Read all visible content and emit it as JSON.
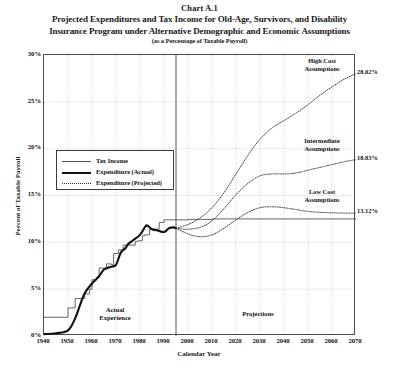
{
  "chart_number": "Chart A.1",
  "title_line1": "Projected Expenditures and Tax Income for Old-Age, Survivors, and Disability",
  "title_line2": "Insurance Program under Alternative Demographic and Economic Assumptions",
  "subtitle": "(as a Percentage of Taxable Payroll)",
  "axes": {
    "ylabel": "Percent of Taxable Payroll",
    "xlabel": "Calendar Year",
    "yticks": [
      "0%",
      "5%",
      "10%",
      "15%",
      "20%",
      "25%",
      "30%"
    ],
    "xticks": [
      "1940",
      "1950",
      "1960",
      "1970",
      "1980",
      "1990",
      "2000",
      "2010",
      "2020",
      "2030",
      "2040",
      "2050",
      "2060",
      "2070"
    ]
  },
  "legend": {
    "items": [
      {
        "label": "Tax Income",
        "style": "thin-solid"
      },
      {
        "label": "Expenditure (Actual)",
        "style": "thick-solid"
      },
      {
        "label": "Expenditure (Projected)",
        "style": "dotted"
      }
    ]
  },
  "annotations": {
    "high_cost": "High Cost\nAssumptions",
    "high_cost_l1": "High Cost",
    "high_cost_l2": "Assumptions",
    "intermediate_l1": "Intermediate",
    "intermediate_l2": "Assumptions",
    "low_cost_l1": "Low Cost",
    "low_cost_l2": "Assumptions",
    "actual_l1": "Actual",
    "actual_l2": "Experience",
    "projections": "Projections",
    "high_cost_value": "28.02%",
    "intermediate_value": "18.83%",
    "low_cost_value": "13.12%"
  },
  "colors": {
    "frame": "#4a4a4a",
    "grid": "#b9b9b9",
    "tax_income": "#555555",
    "expenditure_actual": "#111111",
    "expenditure_projected": "#333333",
    "divider": "#555555",
    "background": "#ffffff"
  },
  "chart_data": {
    "type": "line",
    "title": "Projected Expenditures and Tax Income for Old-Age, Survivors, and Disability Insurance Program under Alternative Demographic and Economic Assumptions",
    "subtitle": "(as a Percentage of Taxable Payroll)",
    "xlabel": "Calendar Year",
    "ylabel": "Percent of Taxable Payroll",
    "xlim": [
      1940,
      2070
    ],
    "ylim": [
      0,
      30
    ],
    "ytick_step": 5,
    "xtick_step": 10,
    "grid": true,
    "legend_position": "inside-left",
    "divider_year": 1995,
    "divider_label_left": "Actual Experience",
    "divider_label_right": "Projections",
    "series": [
      {
        "name": "Tax Income",
        "style": "step",
        "x": [
          1940,
          1949,
          1950,
          1951,
          1953,
          1954,
          1956,
          1957,
          1959,
          1960,
          1962,
          1963,
          1966,
          1968,
          1969,
          1971,
          1973,
          1978,
          1979,
          1981,
          1982,
          1984,
          1985,
          1988,
          1990,
          1991,
          1994,
          1995,
          2000,
          2010,
          2020,
          2030,
          2040,
          2050,
          2060,
          2070
        ],
        "y": [
          2.0,
          2.0,
          3.0,
          3.0,
          4.0,
          4.0,
          4.0,
          4.5,
          5.0,
          6.0,
          6.25,
          7.25,
          7.7,
          7.6,
          8.8,
          9.2,
          9.7,
          10.1,
          10.16,
          10.7,
          10.8,
          11.4,
          11.4,
          12.12,
          12.4,
          12.4,
          12.4,
          12.4,
          12.45,
          12.5,
          12.5,
          12.5,
          12.5,
          12.5,
          12.5,
          12.5
        ]
      },
      {
        "name": "Expenditure (Actual)",
        "style": "solid-thick",
        "x": [
          1940,
          1945,
          1950,
          1953,
          1955,
          1957,
          1960,
          1963,
          1965,
          1968,
          1970,
          1972,
          1974,
          1975,
          1977,
          1980,
          1982,
          1983,
          1985,
          1987,
          1990,
          1992,
          1994,
          1995
        ],
        "y": [
          0.2,
          0.3,
          0.6,
          1.9,
          3.3,
          4.6,
          5.6,
          6.4,
          7.1,
          7.4,
          7.6,
          8.9,
          9.4,
          9.8,
          10.2,
          10.8,
          11.6,
          11.8,
          11.4,
          11.3,
          11.1,
          11.5,
          11.6,
          11.5
        ]
      },
      {
        "name": "High Cost Assumptions",
        "style": "dotted",
        "x": [
          1995,
          2000,
          2005,
          2010,
          2015,
          2020,
          2025,
          2030,
          2035,
          2040,
          2045,
          2050,
          2055,
          2060,
          2065,
          2070
        ],
        "y": [
          11.5,
          11.9,
          12.6,
          13.7,
          15.3,
          17.3,
          19.3,
          21.0,
          22.2,
          23.0,
          23.8,
          24.7,
          25.7,
          26.6,
          27.4,
          28.02
        ],
        "end_value": 28.02,
        "end_label": "28.02%"
      },
      {
        "name": "Intermediate Assumptions",
        "style": "dotted",
        "x": [
          1995,
          2000,
          2005,
          2010,
          2015,
          2020,
          2025,
          2030,
          2035,
          2040,
          2045,
          2050,
          2055,
          2060,
          2065,
          2070
        ],
        "y": [
          11.5,
          11.4,
          11.6,
          12.3,
          13.6,
          15.1,
          16.3,
          17.1,
          17.3,
          17.3,
          17.4,
          17.7,
          18.0,
          18.3,
          18.6,
          18.83
        ],
        "end_value": 18.83,
        "end_label": "18.83%"
      },
      {
        "name": "Low Cost Assumptions",
        "style": "dotted",
        "x": [
          1995,
          2000,
          2005,
          2010,
          2015,
          2020,
          2025,
          2030,
          2035,
          2040,
          2045,
          2050,
          2055,
          2060,
          2065,
          2070
        ],
        "y": [
          11.5,
          10.9,
          10.6,
          10.8,
          11.5,
          12.4,
          13.2,
          13.7,
          13.8,
          13.7,
          13.5,
          13.3,
          13.2,
          13.15,
          13.12,
          13.12
        ],
        "end_value": 13.12,
        "end_label": "13.12%"
      }
    ]
  }
}
